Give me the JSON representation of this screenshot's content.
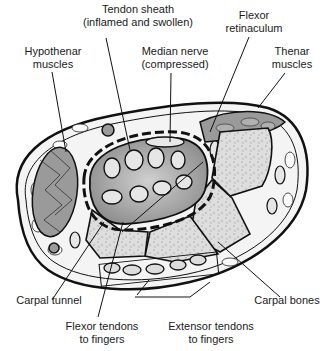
{
  "diagram": {
    "labels": {
      "tendon_sheath": [
        "Tendon sheath",
        "(inflamed and swollen)"
      ],
      "flexor_retinaculum": [
        "Flexor",
        "retinaculum"
      ],
      "hypothenar": [
        "Hypothenar",
        "muscles"
      ],
      "median_nerve": [
        "Median nerve",
        "(compressed)"
      ],
      "thenar": [
        "Thenar",
        "muscles"
      ],
      "carpal_tunnel": [
        "Carpal tunnel"
      ],
      "carpal_bones": [
        "Carpal bones"
      ],
      "flexor_tendons": [
        "Flexor tendons",
        "to fingers"
      ],
      "extensor_tendons": [
        "Extensor tendons",
        "to fingers"
      ]
    },
    "colors": {
      "outline": "#111111",
      "tissue": "#f2f2f2",
      "sheath_fill": "#a9a9a9",
      "tendon_fill": "#e6e6e6",
      "muscle_fill": "#9a9a9a",
      "bone_fill": "#dcdcdc"
    }
  }
}
